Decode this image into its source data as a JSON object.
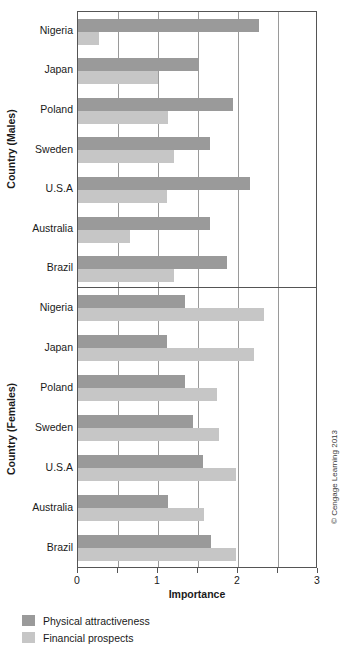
{
  "chart_data": {
    "type": "bar",
    "orientation": "horizontal",
    "title": "",
    "xlabel": "Importance",
    "xlim": [
      0,
      3
    ],
    "xticks": [
      0,
      1,
      2,
      3
    ],
    "xtick_labels": [
      "0",
      "1",
      "2",
      "3"
    ],
    "gridlines": [
      0,
      0.5,
      1,
      1.5,
      2,
      2.5,
      3
    ],
    "grid": true,
    "legend_position": "bottom-left",
    "series": [
      {
        "name": "Physical attractiveness",
        "color": "#9a9a9a"
      },
      {
        "name": "Financial prospects",
        "color": "#c6c6c6"
      }
    ],
    "panels": [
      {
        "ylabel": "Country (Males)",
        "categories": [
          "Nigeria",
          "Japan",
          "Poland",
          "Sweden",
          "U.S.A",
          "Australia",
          "Brazil"
        ],
        "values": {
          "Physical attractiveness": [
            2.26,
            1.5,
            1.94,
            1.65,
            2.15,
            1.65,
            1.86
          ],
          "Financial prospects": [
            0.26,
            1.0,
            1.13,
            1.2,
            1.11,
            0.65,
            1.2
          ]
        }
      },
      {
        "ylabel": "Country (Females)",
        "categories": [
          "Nigeria",
          "Japan",
          "Poland",
          "Sweden",
          "U.S.A",
          "Australia",
          "Brazil"
        ],
        "values": {
          "Physical attractiveness": [
            1.34,
            1.11,
            1.34,
            1.44,
            1.56,
            1.13,
            1.66
          ],
          "Financial prospects": [
            2.33,
            2.2,
            1.74,
            1.76,
            1.98,
            1.58,
            1.98
          ]
        }
      }
    ]
  },
  "axes": {
    "y_males": "Country (Males)",
    "y_females": "Country (Females)",
    "x": "Importance"
  },
  "legend": {
    "items": [
      {
        "label": "Physical attractiveness",
        "color": "#9a9a9a"
      },
      {
        "label": "Financial prospects",
        "color": "#c6c6c6"
      }
    ]
  },
  "credit": "© Cengage Learning 2013"
}
